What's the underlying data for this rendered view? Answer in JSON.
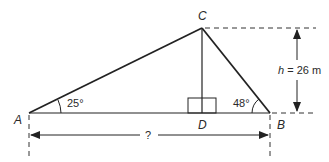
{
  "diagram": {
    "points": {
      "A": {
        "label": "A",
        "x": 29,
        "y": 113
      },
      "B": {
        "label": "B",
        "x": 270,
        "y": 113
      },
      "C": {
        "label": "C",
        "x": 202,
        "y": 28
      },
      "D": {
        "label": "D",
        "x": 202,
        "y": 113
      }
    },
    "angles": {
      "A": "25°",
      "B": "48°"
    },
    "height": {
      "var": "h",
      "text": " = 26 m"
    },
    "base_unknown": "?",
    "colors": {
      "line": "#222222"
    }
  }
}
